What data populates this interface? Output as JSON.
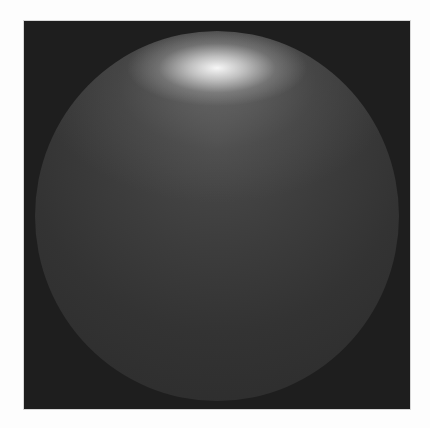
{
  "image": {
    "subject": "shaded sphere with specular highlight",
    "background_color": "#1e1e1e",
    "page_color": "#fdfdfd",
    "sphere_base_color": "#333333",
    "highlight_color": "#ffffff"
  }
}
